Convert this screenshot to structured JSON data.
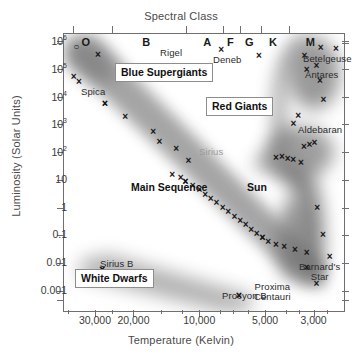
{
  "chart_data": {
    "type": "scatter",
    "top_axis_title": "Spectral Class",
    "xlabel": "Temperature (Kelvin)",
    "ylabel": "Luminosity (Solar Units)",
    "xscale": "log-reversed",
    "yscale": "log",
    "xlim": [
      42000,
      2200
    ],
    "ylim": [
      0.0002,
      2000000
    ],
    "grid": false,
    "legend": "none",
    "xticks": [
      "30,000",
      "20,000",
      "10,000",
      "5,000",
      "3,000"
    ],
    "xtick_values": [
      30000,
      20000,
      10000,
      5000,
      3000
    ],
    "yticks": [
      "10⁶",
      "10⁵",
      "10⁴",
      "10³",
      "10²",
      "10",
      "1",
      "0.1",
      "0.01",
      "0.001"
    ],
    "ytick_values": [
      1000000,
      100000,
      10000,
      1000,
      100,
      10,
      1,
      0.1,
      0.01,
      0.001
    ],
    "spectral_classes": [
      {
        "label": "O",
        "x": 33000
      },
      {
        "label": "B",
        "x": 17500
      },
      {
        "label": "A",
        "x": 9200
      },
      {
        "label": "F",
        "x": 7200
      },
      {
        "label": "G",
        "x": 5900
      },
      {
        "label": "K",
        "x": 4600
      },
      {
        "label": "M",
        "x": 3100
      }
    ],
    "regions": [
      {
        "name": "Blue Supergiants",
        "style": "boxed"
      },
      {
        "name": "Red Giants",
        "style": "boxed"
      },
      {
        "name": "White Dwarfs",
        "style": "boxed"
      },
      {
        "name": "Main Sequence",
        "style": "plain"
      }
    ],
    "named_stars": [
      {
        "name": "Rigel",
        "temperature": 11000,
        "luminosity": 120000,
        "label_side": "left"
      },
      {
        "name": "Deneb",
        "temperature": 8500,
        "luminosity": 90000,
        "label_side": "right"
      },
      {
        "name": "Betelgeuse",
        "temperature": 3400,
        "luminosity": 75000,
        "label_side": "right"
      },
      {
        "name": "Antares",
        "temperature": 3300,
        "luminosity": 30000,
        "label_side": "right"
      },
      {
        "name": "Aldebaran",
        "temperature": 3900,
        "luminosity": 280,
        "label_side": "right"
      },
      {
        "name": "Spica",
        "temperature": 22000,
        "luminosity": 12000,
        "label_side": "below"
      },
      {
        "name": "Sirius",
        "temperature": 9600,
        "luminosity": 25,
        "label_side": "above"
      },
      {
        "name": "Sun",
        "temperature": 5800,
        "luminosity": 1,
        "label_side": "right"
      },
      {
        "name": "Sirius B",
        "temperature": 26000,
        "luminosity": 0.03,
        "label_side": "below"
      },
      {
        "name": "Procyon B",
        "temperature": 6200,
        "luminosity": 0.0006,
        "label_side": "below"
      },
      {
        "name": "Barnard's Star",
        "temperature": 3100,
        "luminosity": 0.004,
        "label_side": "right"
      },
      {
        "name": "Proxima Centauri",
        "temperature": 3000,
        "luminosity": 0.0015,
        "label_side": "left"
      }
    ],
    "points": [
      {
        "px": 0.047,
        "py": 0.049,
        "marker": "open"
      },
      {
        "px": 0.125,
        "py": 0.079,
        "marker": "x"
      },
      {
        "px": 0.038,
        "py": 0.156,
        "marker": "x"
      },
      {
        "px": 0.057,
        "py": 0.175,
        "marker": "x"
      },
      {
        "px": 0.15,
        "py": 0.254,
        "marker": "x"
      },
      {
        "px": 0.222,
        "py": 0.3,
        "marker": "x"
      },
      {
        "px": 0.322,
        "py": 0.356,
        "marker": "x"
      },
      {
        "px": 0.344,
        "py": 0.39,
        "marker": "x"
      },
      {
        "px": 0.404,
        "py": 0.418,
        "marker": "x"
      },
      {
        "px": 0.448,
        "py": 0.46,
        "marker": "x"
      },
      {
        "px": 0.39,
        "py": 0.51,
        "marker": "x"
      },
      {
        "px": 0.42,
        "py": 0.521,
        "marker": "x"
      },
      {
        "px": 0.437,
        "py": 0.536,
        "marker": "x"
      },
      {
        "px": 0.463,
        "py": 0.551,
        "marker": "x"
      },
      {
        "px": 0.487,
        "py": 0.566,
        "marker": "x"
      },
      {
        "px": 0.508,
        "py": 0.582,
        "marker": "x"
      },
      {
        "px": 0.527,
        "py": 0.598,
        "marker": "x"
      },
      {
        "px": 0.548,
        "py": 0.613,
        "marker": "x"
      },
      {
        "px": 0.57,
        "py": 0.629,
        "marker": "x"
      },
      {
        "px": 0.59,
        "py": 0.645,
        "marker": "x"
      },
      {
        "px": 0.612,
        "py": 0.661,
        "marker": "x"
      },
      {
        "px": 0.633,
        "py": 0.676,
        "marker": "x"
      },
      {
        "px": 0.652,
        "py": 0.692,
        "marker": "x"
      },
      {
        "px": 0.672,
        "py": 0.708,
        "marker": "x"
      },
      {
        "px": 0.692,
        "py": 0.724,
        "marker": "x"
      },
      {
        "px": 0.712,
        "py": 0.739,
        "marker": "x"
      },
      {
        "px": 0.733,
        "py": 0.752,
        "marker": "x"
      },
      {
        "px": 0.76,
        "py": 0.762,
        "marker": "x"
      },
      {
        "px": 0.79,
        "py": 0.772,
        "marker": "x"
      },
      {
        "px": 0.828,
        "py": 0.782,
        "marker": "x"
      },
      {
        "px": 0.87,
        "py": 0.792,
        "marker": "x"
      },
      {
        "px": 0.92,
        "py": 0.054,
        "marker": "x"
      },
      {
        "px": 0.975,
        "py": 0.056,
        "marker": "x"
      },
      {
        "px": 0.905,
        "py": 0.118,
        "marker": "x"
      },
      {
        "px": 0.918,
        "py": 0.17,
        "marker": "x"
      },
      {
        "px": 0.93,
        "py": 0.24,
        "marker": "x"
      },
      {
        "px": 0.84,
        "py": 0.298,
        "marker": "x"
      },
      {
        "px": 0.86,
        "py": 0.408,
        "marker": "x"
      },
      {
        "px": 0.88,
        "py": 0.402,
        "marker": "x"
      },
      {
        "px": 0.898,
        "py": 0.396,
        "marker": "x"
      },
      {
        "px": 0.76,
        "py": 0.448,
        "marker": "x"
      },
      {
        "px": 0.782,
        "py": 0.446,
        "marker": "x"
      },
      {
        "px": 0.802,
        "py": 0.452,
        "marker": "x"
      },
      {
        "px": 0.822,
        "py": 0.458,
        "marker": "x"
      },
      {
        "px": 0.85,
        "py": 0.468,
        "marker": "x"
      },
      {
        "px": 0.908,
        "py": 0.63,
        "marker": "x"
      },
      {
        "px": 0.928,
        "py": 0.726,
        "marker": "x"
      },
      {
        "px": 0.952,
        "py": 0.806,
        "marker": "x"
      },
      {
        "px": 0.14,
        "py": 0.852,
        "marker": "x"
      },
      {
        "px": 0.3,
        "py": 0.88,
        "marker": "x"
      },
      {
        "px": 0.628,
        "py": 0.946,
        "marker": "x"
      }
    ]
  },
  "axes": {
    "top_title": "Spectral Class",
    "x_title": "Temperature (Kelvin)",
    "y_title": "Luminosity (Solar Units)"
  }
}
